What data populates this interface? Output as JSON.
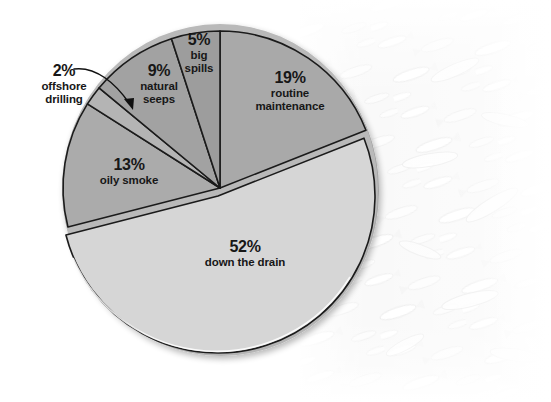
{
  "figure": {
    "kind": "pie-chart-infographic",
    "background_image_subject": "dead fish washed ashore (faded photograph)"
  },
  "chart_data": {
    "type": "pie",
    "title": "",
    "subtitle": "",
    "xlabel": "",
    "ylabel": "",
    "legend_position": "none",
    "grid": false,
    "total": 100,
    "units": "percent",
    "categories": [
      "routine maintenance",
      "down the drain",
      "oily smoke",
      "offshore drilling",
      "natural seeps",
      "big spills"
    ],
    "values": [
      19,
      52,
      13,
      2,
      9,
      5
    ],
    "slices": [
      {
        "id": "routine-maintenance",
        "percent_label": "19%",
        "name_line1": "routine",
        "name_line2": "maintenance",
        "value": 19,
        "color": "#a9a9a9",
        "start_angle_deg": 0,
        "end_angle_deg": 68.4,
        "exploded": false
      },
      {
        "id": "down-the-drain",
        "percent_label": "52%",
        "name_line1": "down the drain",
        "name_line2": "",
        "value": 52,
        "color": "#d6d6d6",
        "start_angle_deg": 68.4,
        "end_angle_deg": 255.6,
        "exploded": true
      },
      {
        "id": "oily-smoke",
        "percent_label": "13%",
        "name_line1": "oily smoke",
        "name_line2": "",
        "value": 13,
        "color": "#ababab",
        "start_angle_deg": 255.6,
        "end_angle_deg": 302.4,
        "exploded": false
      },
      {
        "id": "offshore-drilling",
        "percent_label": "2%",
        "name_line1": "offshore",
        "name_line2": "drilling",
        "value": 2,
        "color": "#b4b4b4",
        "start_angle_deg": 302.4,
        "end_angle_deg": 309.6,
        "exploded": false
      },
      {
        "id": "natural-seeps",
        "percent_label": "9%",
        "name_line1": "natural",
        "name_line2": "seeps",
        "value": 9,
        "color": "#a2a2a2",
        "start_angle_deg": 309.6,
        "end_angle_deg": 342.0,
        "exploded": false
      },
      {
        "id": "big-spills",
        "percent_label": "5%",
        "name_line1": "big",
        "name_line2": "spills",
        "value": 5,
        "color": "#9d9d9d",
        "start_angle_deg": 342.0,
        "end_angle_deg": 360.0,
        "exploded": false
      }
    ],
    "annotations": [
      {
        "id": "offshore-drilling-callout",
        "text": "2% offshore drilling",
        "type": "curved-arrow",
        "points_to": "offshore-drilling"
      }
    ],
    "colors": {
      "slice_light": "#d6d6d6",
      "slice_mid": "#a9a9a9",
      "slice_edge": "#1b1b1b",
      "rim": "#9a9a9a",
      "label_text": "#171717",
      "background": "#ffffff"
    }
  }
}
